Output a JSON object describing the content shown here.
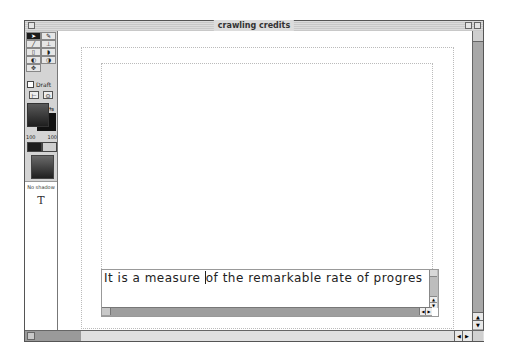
{
  "window": {
    "title": "crawling credits"
  },
  "palette": {
    "tools": [
      {
        "name": "arrow-tool",
        "glyph": "➤",
        "selected": true
      },
      {
        "name": "eyedropper-tool",
        "glyph": "✎",
        "selected": false
      },
      {
        "name": "line-tool",
        "glyph": "╱",
        "selected": false
      },
      {
        "name": "text-insert-tool",
        "glyph": "⊥",
        "selected": false
      },
      {
        "name": "rect-tool",
        "glyph": "▯",
        "selected": false
      },
      {
        "name": "rounded-rect-tool",
        "glyph": "◗",
        "selected": false
      },
      {
        "name": "oval-tool",
        "glyph": "◐",
        "selected": false
      },
      {
        "name": "ellipse-tool",
        "glyph": "◑",
        "selected": false
      },
      {
        "name": "move-tool",
        "glyph": "✥",
        "selected": false
      }
    ],
    "draft_label": "Draft",
    "draft_checked": false,
    "align_left_glyph": "⊢",
    "align_center_glyph": "⊙",
    "swap_glyph": "⇆",
    "opacity_left": "100",
    "opacity_right": "100",
    "shadow_label": "No shadow",
    "text_tool_glyph": "T"
  },
  "textbox": {
    "content_before_caret": "It is a measure ",
    "content_after_caret": "of the remarkable rate of progres"
  },
  "scroll": {
    "up_glyph": "▲",
    "down_glyph": "▼",
    "left_glyph": "◀",
    "right_glyph": "▶"
  }
}
